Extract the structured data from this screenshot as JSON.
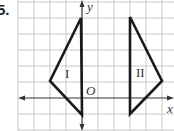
{
  "problem": {
    "number": "5."
  },
  "axes": {
    "x_label": "x",
    "y_label": "y",
    "origin_label": "O"
  },
  "grid": {
    "cell_px": 16,
    "color": "#c8c8c8"
  },
  "figures": [
    {
      "label": "I",
      "vertices_px": [
        [
          81,
          18
        ],
        [
          50,
          81
        ],
        [
          82,
          115
        ]
      ],
      "vertices_grid": [
        [
          0,
          5
        ],
        [
          -2,
          1
        ],
        [
          0,
          -1
        ]
      ]
    },
    {
      "label": "II",
      "vertices_px": [
        [
          130,
          17
        ],
        [
          162,
          81
        ],
        [
          130,
          114
        ]
      ],
      "vertices_grid": [
        [
          3,
          5
        ],
        [
          5,
          1
        ],
        [
          3,
          -1
        ]
      ]
    }
  ],
  "colors": {
    "stroke": "#1a1a1a",
    "axis": "#333333"
  }
}
